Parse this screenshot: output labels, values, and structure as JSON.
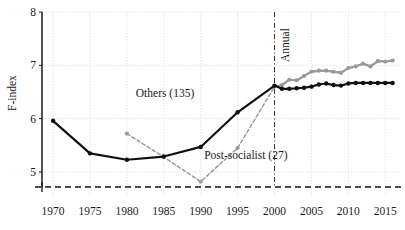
{
  "chart_data": {
    "type": "line",
    "title": "",
    "xlabel": "",
    "ylabel": "F-index",
    "xlim": [
      1968.5,
      2017.0
    ],
    "ylim": [
      4.55,
      8.0
    ],
    "grid": true,
    "legend_position": "inline-annotations",
    "x_ticks": [
      1970,
      1975,
      1980,
      1985,
      1990,
      1995,
      2000,
      2005,
      2010,
      2015
    ],
    "x_tick_labels": [
      "1970",
      "1975",
      "1980",
      "1985",
      "1990",
      "1995",
      "2000",
      "2005",
      "2010",
      "2015"
    ],
    "y_ticks": [
      5,
      6,
      7,
      8
    ],
    "y_tick_labels": [
      "5",
      "6",
      "7",
      "8"
    ],
    "annotations": [
      {
        "text": "Annual",
        "x": 2000,
        "orientation": "vertical",
        "note": "vertical dash-dot divider marking switch to annual data"
      },
      {
        "text": "Others (135)",
        "x": 1985,
        "y": 6.45,
        "series": "others"
      },
      {
        "text": "Post-socialist (27)",
        "x": 1999,
        "y": 5.28,
        "series": "post_socialist"
      }
    ],
    "vertical_divider": {
      "x": 2000,
      "style": "dash-dot",
      "color": "#333333"
    },
    "baseline": {
      "y": 4.72,
      "style": "dashed",
      "color": "#111111"
    },
    "series": [
      {
        "name": "Others (135)",
        "label": "Others (135)",
        "count": 135,
        "color": "#111111",
        "marker": "circle",
        "quinquennial_points": [
          {
            "x": 1970,
            "y": 5.96
          },
          {
            "x": 1975,
            "y": 5.35
          },
          {
            "x": 1980,
            "y": 5.23
          },
          {
            "x": 1985,
            "y": 5.29
          },
          {
            "x": 1990,
            "y": 5.47
          },
          {
            "x": 1995,
            "y": 6.12
          },
          {
            "x": 2000,
            "y": 6.62
          }
        ],
        "annual_points": [
          {
            "x": 2001,
            "y": 6.56
          },
          {
            "x": 2002,
            "y": 6.56
          },
          {
            "x": 2003,
            "y": 6.57
          },
          {
            "x": 2004,
            "y": 6.58
          },
          {
            "x": 2005,
            "y": 6.6
          },
          {
            "x": 2006,
            "y": 6.64
          },
          {
            "x": 2007,
            "y": 6.66
          },
          {
            "x": 2008,
            "y": 6.63
          },
          {
            "x": 2009,
            "y": 6.62
          },
          {
            "x": 2010,
            "y": 6.66
          },
          {
            "x": 2011,
            "y": 6.67
          },
          {
            "x": 2012,
            "y": 6.67
          },
          {
            "x": 2013,
            "y": 6.67
          },
          {
            "x": 2014,
            "y": 6.67
          },
          {
            "x": 2015,
            "y": 6.67
          },
          {
            "x": 2016,
            "y": 6.67
          }
        ]
      },
      {
        "name": "Post-socialist (27)",
        "label": "Post-socialist (27)",
        "count": 27,
        "color": "#9a9a9a",
        "marker": "circle",
        "dashed_segment": true,
        "quinquennial_points": [
          {
            "x": 1980,
            "y": 5.72
          },
          {
            "x": 1985,
            "y": 5.28
          },
          {
            "x": 1990,
            "y": 4.82
          },
          {
            "x": 1995,
            "y": 5.45
          },
          {
            "x": 2000,
            "y": 6.6
          }
        ],
        "annual_points": [
          {
            "x": 2001,
            "y": 6.63
          },
          {
            "x": 2002,
            "y": 6.73
          },
          {
            "x": 2003,
            "y": 6.72
          },
          {
            "x": 2004,
            "y": 6.8
          },
          {
            "x": 2005,
            "y": 6.88
          },
          {
            "x": 2006,
            "y": 6.9
          },
          {
            "x": 2007,
            "y": 6.9
          },
          {
            "x": 2008,
            "y": 6.88
          },
          {
            "x": 2009,
            "y": 6.86
          },
          {
            "x": 2010,
            "y": 6.95
          },
          {
            "x": 2011,
            "y": 6.98
          },
          {
            "x": 2012,
            "y": 7.03
          },
          {
            "x": 2013,
            "y": 6.98
          },
          {
            "x": 2014,
            "y": 7.08
          },
          {
            "x": 2015,
            "y": 7.07
          },
          {
            "x": 2016,
            "y": 7.09
          }
        ]
      }
    ]
  },
  "axes": {
    "y_title": "F-index"
  }
}
